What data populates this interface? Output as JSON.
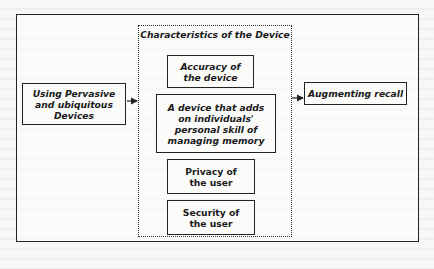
{
  "diagram": {
    "input": {
      "label": "Using Pervasive and ubiquitous Devices"
    },
    "group": {
      "title": "Characteristics of the Device",
      "items": [
        {
          "label": "Accuracy of the device",
          "style": "bold-italic"
        },
        {
          "label": "A device that adds on individuals' personal skill of managing memory",
          "style": "bold-italic"
        },
        {
          "label": "Privacy of the user",
          "style": "bold"
        },
        {
          "label": "Security of the user",
          "style": "bold"
        }
      ]
    },
    "output": {
      "label": "Augmenting recall"
    },
    "edges": [
      {
        "from": "Using Pervasive and ubiquitous Devices",
        "to": "Characteristics of the Device"
      },
      {
        "from": "Characteristics of the Device",
        "to": "Augmenting recall"
      }
    ],
    "colors": {
      "stroke": "#222222",
      "background": "#f7f7f5"
    }
  }
}
